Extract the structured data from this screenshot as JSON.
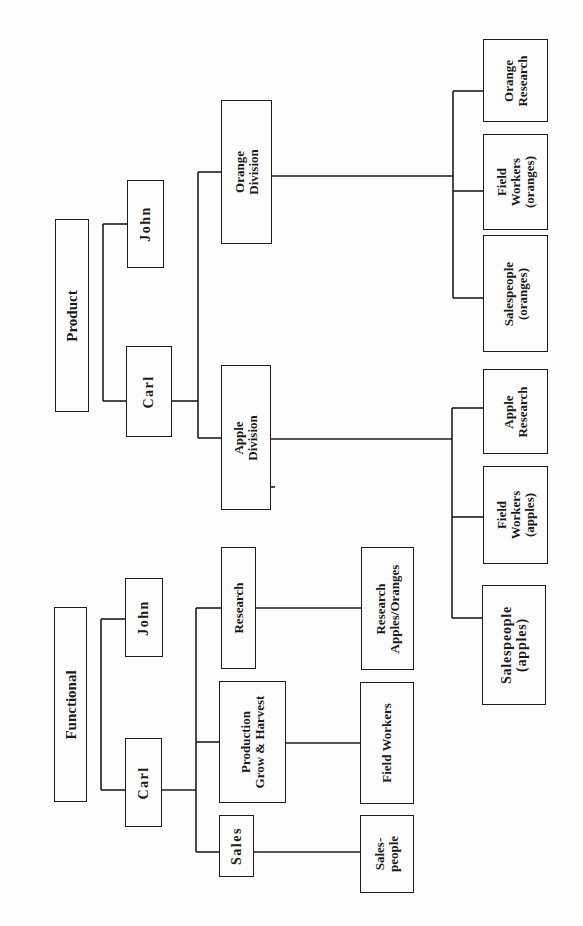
{
  "diagram": {
    "type": "org-chart",
    "orientation": "rotated-90-ccw",
    "line_color": "#1c1c1c",
    "background": "#fdfdfd"
  },
  "product": {
    "title": "Product",
    "top_level": [
      {
        "id": "carl",
        "label": "Carl"
      },
      {
        "id": "john",
        "label": "John"
      }
    ],
    "divisions": [
      {
        "id": "apple-division",
        "label": "Apple\nDivision",
        "children": [
          {
            "label": "Salespeople\n(apples)"
          },
          {
            "label": "Field\nWorkers\n(apples)"
          },
          {
            "label": "Apple\nResearch"
          }
        ]
      },
      {
        "id": "orange-division",
        "label": "Orange\nDivision",
        "children": [
          {
            "label": "Salespeople\n(oranges)"
          },
          {
            "label": "Field\nWorkers\n(oranges)"
          },
          {
            "label": "Orange\nResearch"
          }
        ]
      }
    ]
  },
  "functional": {
    "title": "Functional",
    "top_level": [
      {
        "id": "carl",
        "label": "Carl"
      },
      {
        "id": "john",
        "label": "John"
      }
    ],
    "departments": [
      {
        "id": "sales",
        "label": "Sales",
        "child": "Sales-\npeople"
      },
      {
        "id": "production",
        "label": "Production\nGrow & Harvest",
        "child": "Field Workers"
      },
      {
        "id": "research",
        "label": "Research",
        "child": "Research\nApples/Oranges"
      }
    ]
  }
}
